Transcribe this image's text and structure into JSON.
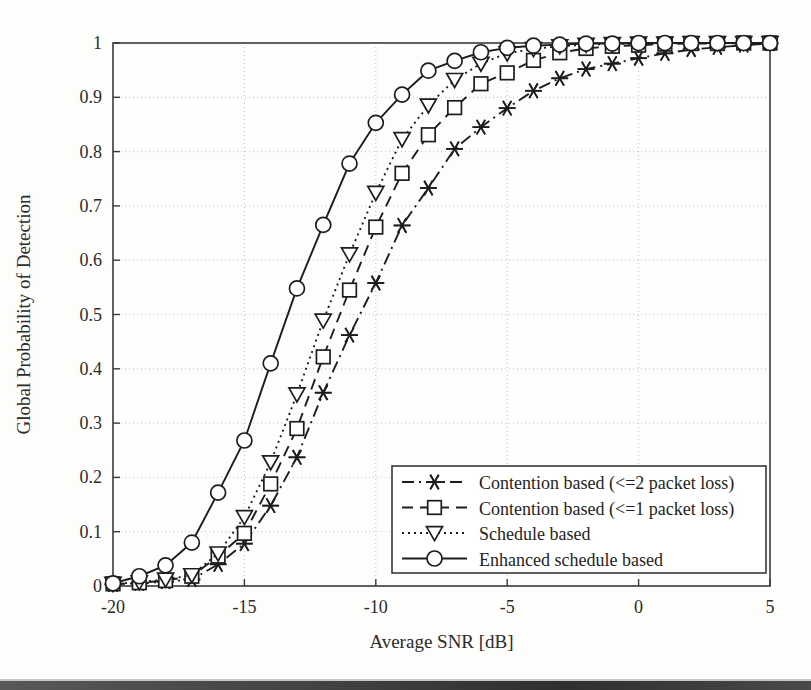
{
  "figure": {
    "background_color": "#fdfdfc",
    "line_color": "#1d1d1d",
    "grid_color": "#b9b9b9"
  },
  "axes": {
    "x_title": "Average SNR [dB]",
    "y_title": "Global Probability of Detection",
    "x_ticks": [
      "-20",
      "-15",
      "-10",
      "-5",
      "0",
      "5"
    ],
    "y_ticks": [
      "0",
      "0.1",
      "0.2",
      "0.3",
      "0.4",
      "0.5",
      "0.6",
      "0.7",
      "0.8",
      "0.9",
      "1"
    ]
  },
  "legend": {
    "items": [
      {
        "label": "Contention based (<=2 packet loss)",
        "marker": "star-icon",
        "line": "dash-dot"
      },
      {
        "label": "Contention based (<=1 packet loss)",
        "marker": "square-icon",
        "line": "dashed"
      },
      {
        "label": "Schedule based",
        "marker": "triangle-down-icon",
        "line": "dotted"
      },
      {
        "label": "Enhanced schedule based",
        "marker": "circle-icon",
        "line": "solid"
      }
    ]
  },
  "chart_data": {
    "type": "line",
    "title": "",
    "xlabel": "Average SNR [dB]",
    "ylabel": "Global Probability of Detection",
    "xlim": [
      -20,
      5
    ],
    "ylim": [
      0,
      1
    ],
    "xticks": [
      -20,
      -15,
      -10,
      -5,
      0,
      5
    ],
    "yticks": [
      0,
      0.1,
      0.2,
      0.3,
      0.4,
      0.5,
      0.6,
      0.7,
      0.8,
      0.9,
      1
    ],
    "grid": true,
    "legend_position": "lower right",
    "x": [
      -20,
      -19,
      -18,
      -17,
      -16,
      -15,
      -14,
      -13,
      -12,
      -11,
      -10,
      -9,
      -8,
      -7,
      -6,
      -5,
      -4,
      -3,
      -2,
      -1,
      0,
      1,
      2,
      3,
      4,
      5
    ],
    "series": [
      {
        "name": "Contention based (<=2 packet loss)",
        "marker": "star",
        "line": "dash-dot",
        "values": [
          0.003,
          0.005,
          0.008,
          0.012,
          0.04,
          0.078,
          0.148,
          0.237,
          0.356,
          0.462,
          0.558,
          0.664,
          0.733,
          0.805,
          0.845,
          0.88,
          0.912,
          0.935,
          0.952,
          0.962,
          0.972,
          0.981,
          0.988,
          0.992,
          0.996,
          0.999
        ]
      },
      {
        "name": "Contention based (<=1 packet loss)",
        "marker": "square",
        "line": "dashed",
        "values": [
          0.004,
          0.006,
          0.01,
          0.018,
          0.055,
          0.097,
          0.188,
          0.29,
          0.422,
          0.545,
          0.661,
          0.76,
          0.831,
          0.881,
          0.925,
          0.945,
          0.968,
          0.982,
          0.99,
          0.994,
          0.996,
          0.998,
          0.999,
          0.999,
          1.0,
          1.0
        ]
      },
      {
        "name": "Schedule based",
        "marker": "triangle-down",
        "line": "dotted",
        "values": [
          0.004,
          0.007,
          0.012,
          0.02,
          0.06,
          0.127,
          0.228,
          0.353,
          0.489,
          0.611,
          0.724,
          0.823,
          0.885,
          0.932,
          0.962,
          0.981,
          0.989,
          0.994,
          0.997,
          0.998,
          0.999,
          0.999,
          1.0,
          1.0,
          1.0,
          1.0
        ]
      },
      {
        "name": "Enhanced schedule based",
        "marker": "circle",
        "line": "solid",
        "values": [
          0.005,
          0.018,
          0.038,
          0.08,
          0.172,
          0.268,
          0.41,
          0.548,
          0.665,
          0.778,
          0.853,
          0.905,
          0.949,
          0.967,
          0.983,
          0.991,
          0.995,
          0.997,
          0.999,
          0.999,
          1.0,
          1.0,
          1.0,
          1.0,
          1.0,
          1.0
        ]
      }
    ]
  }
}
